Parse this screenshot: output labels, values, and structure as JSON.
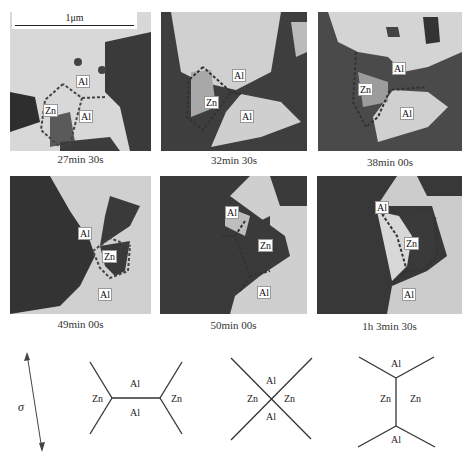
{
  "figure": {
    "scale_bar": "1μm",
    "panels": [
      {
        "caption": "27min 30s",
        "labels": [
          "Al",
          "Zn",
          "Al"
        ]
      },
      {
        "caption": "32min 30s",
        "labels": [
          "Al",
          "Zn",
          "Al"
        ]
      },
      {
        "caption": "38min 00s",
        "labels": [
          "Al",
          "Zn",
          "Al"
        ]
      },
      {
        "caption": "49min 00s",
        "labels": [
          "Al",
          "Zn",
          "Al"
        ]
      },
      {
        "caption": "50min 00s",
        "labels": [
          "Al",
          "Zn",
          "Al"
        ]
      },
      {
        "caption": "1h 3min 30s",
        "labels": [
          "Al",
          "Zn",
          "Al"
        ]
      }
    ],
    "stress_symbol": "σ",
    "schematics": [
      {
        "labels": {
          "top": "Al",
          "bottom": "Al",
          "left": "Zn",
          "right": "Zn"
        }
      },
      {
        "labels": {
          "top": "Al",
          "bottom": "Al",
          "left": "Zn",
          "right": "Zn"
        }
      },
      {
        "labels": {
          "top": "Al",
          "bottom": "Al",
          "left": "Zn",
          "right": "Zn"
        }
      }
    ]
  }
}
